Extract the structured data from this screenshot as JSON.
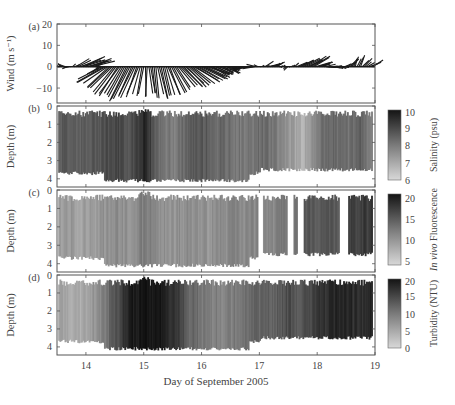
{
  "figure": {
    "xlabel": "Day of September 2005",
    "x_ticks": [
      14,
      15,
      16,
      17,
      18,
      19
    ],
    "x_range": [
      13.5,
      19.0
    ]
  },
  "chart_data": [
    {
      "type": "line",
      "panel": "(a)",
      "title": "",
      "ylabel": "Wind (m s⁻¹)",
      "ylim": [
        -17,
        20
      ],
      "y_ticks": [
        20,
        10,
        0,
        -10
      ],
      "xlabel": "Day of September 2005",
      "description": "wind stick/vector plot",
      "series": [
        {
          "name": "wind_u",
          "x": [
            13.5,
            13.7,
            13.9,
            14.1,
            14.3,
            14.5,
            14.7,
            14.9,
            15.1,
            15.3,
            15.5,
            15.7,
            15.9,
            16.1,
            16.3,
            16.5,
            16.7,
            16.9,
            17.1,
            17.3,
            17.5,
            17.7,
            17.9,
            18.1,
            18.3,
            18.5,
            18.7,
            18.9
          ],
          "values": [
            0.5,
            -2,
            6,
            7,
            -8,
            -6,
            -5,
            -3,
            1,
            2,
            4,
            6,
            7,
            6,
            4,
            3,
            -3,
            -4,
            3,
            2,
            -1,
            4,
            5,
            3,
            2,
            2,
            1,
            3
          ]
        },
        {
          "name": "wind_v",
          "x": [
            13.5,
            13.7,
            13.9,
            14.1,
            14.3,
            14.5,
            14.7,
            14.9,
            15.1,
            15.3,
            15.5,
            15.7,
            15.9,
            16.1,
            16.3,
            16.5,
            16.7,
            16.9,
            17.1,
            17.3,
            17.5,
            17.7,
            17.9,
            18.1,
            18.3,
            18.5,
            18.7,
            18.9
          ],
          "values": [
            1,
            0,
            4,
            3,
            -6,
            -12,
            -15,
            -14,
            -13,
            -14,
            -11,
            -9,
            -7,
            -5,
            -3,
            -2,
            -1,
            0,
            2,
            1,
            -1,
            3,
            4,
            1,
            0,
            1,
            5,
            2
          ]
        }
      ]
    },
    {
      "type": "heatmap",
      "panel": "(b)",
      "ylabel": "Depth (m)",
      "y_ticks": [
        0,
        1,
        2,
        3,
        4
      ],
      "colorbar": {
        "label": "Salinity (psu)",
        "ticks": [
          10,
          9,
          8,
          7,
          6
        ],
        "range": [
          6,
          10
        ]
      },
      "x": [
        13.5,
        13.75,
        14.0,
        14.25,
        14.5,
        14.75,
        15.0,
        15.25,
        15.5,
        15.75,
        16.0,
        16.25,
        16.5,
        16.75,
        17.0,
        17.25,
        17.5,
        17.75,
        18.0,
        18.25,
        18.5,
        18.75,
        18.95
      ],
      "values": [
        8.5,
        8.6,
        8.4,
        8.8,
        8.9,
        8.7,
        9.6,
        8.2,
        7.8,
        8.4,
        8.6,
        8.3,
        8.1,
        7.9,
        8.2,
        8.0,
        7.4,
        6.8,
        8.0,
        8.3,
        8.1,
        8.4,
        7.8
      ]
    },
    {
      "type": "heatmap",
      "panel": "(c)",
      "ylabel": "Depth (m)",
      "y_ticks": [
        0,
        1,
        2,
        3,
        4
      ],
      "colorbar": {
        "label": "In vivo Fluorescence",
        "ticks": [
          20,
          15,
          10,
          5
        ],
        "range": [
          4,
          21
        ]
      },
      "x": [
        13.5,
        13.75,
        14.0,
        14.25,
        14.5,
        14.75,
        15.0,
        15.25,
        15.5,
        15.75,
        16.0,
        16.25,
        16.5,
        16.75,
        17.0,
        17.25,
        17.5,
        17.75,
        18.0,
        18.25,
        18.5,
        18.75,
        18.95
      ],
      "values": [
        9,
        9.5,
        9,
        10,
        10.5,
        10,
        12,
        10.5,
        10,
        10.5,
        10,
        10.5,
        11,
        11,
        null,
        11,
        13,
        null,
        15,
        15,
        null,
        17,
        18
      ],
      "gaps": [
        [
          16.97,
          17.05
        ],
        [
          17.47,
          17.57
        ],
        [
          17.64,
          17.75
        ],
        [
          18.37,
          18.52
        ]
      ]
    },
    {
      "type": "heatmap",
      "panel": "(d)",
      "ylabel": "Depth (m)",
      "y_ticks": [
        0,
        1,
        2,
        3,
        4
      ],
      "colorbar": {
        "label": "Turbidity (NTU)",
        "ticks": [
          20,
          15,
          10,
          5,
          0
        ],
        "range": [
          0,
          20
        ]
      },
      "x": [
        13.5,
        13.75,
        14.0,
        14.25,
        14.5,
        14.75,
        15.0,
        15.25,
        15.5,
        15.75,
        16.0,
        16.25,
        16.5,
        16.75,
        17.0,
        17.25,
        17.5,
        17.75,
        18.0,
        18.25,
        18.5,
        18.75,
        18.95
      ],
      "values": [
        6,
        5,
        5,
        9,
        13,
        19,
        20,
        19,
        17,
        12,
        10,
        9,
        9,
        11,
        12,
        12,
        14,
        13,
        16,
        18,
        18,
        17,
        18
      ]
    }
  ]
}
